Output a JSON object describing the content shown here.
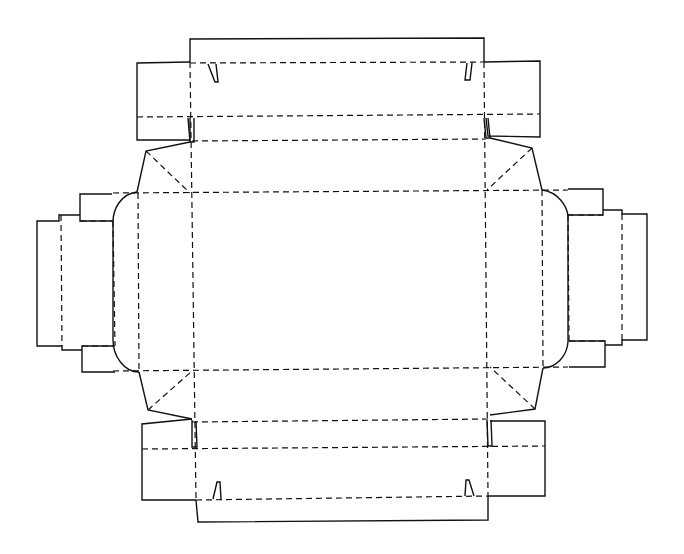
{
  "diagram": {
    "type": "box-net-dieline",
    "width": 684,
    "height": 554,
    "colors": {
      "background": "#ffffff",
      "line": "#111111"
    },
    "cut_lines": [
      {
        "name": "top-lid-flap",
        "points": "190,62 190,39 484,38 484,62"
      },
      {
        "name": "top-left-dust-flap",
        "points": "190,62 137,63 137,140 190,140 190,118"
      },
      {
        "name": "top-right-dust-flap",
        "points": "484,62 540,61 540,137 488,136 486,118"
      },
      {
        "name": "top-left-slot",
        "points": "188,118 190,142 194,142 194,118"
      },
      {
        "name": "top-right-slot",
        "points": "484,118 486,138 490,138 488,118"
      },
      {
        "name": "top-left-notch",
        "points": "208,64 215,82 218,82 216,64"
      },
      {
        "name": "top-right-notch",
        "points": "472,63 470,80 465,80 467,63"
      },
      {
        "name": "upper-left-gusset",
        "points": "190,142 146,151 137,192"
      },
      {
        "name": "upper-right-gusset",
        "points": "490,138 532,148 542,190"
      },
      {
        "name": "left-rounded-edge",
        "points": "137,192 C 120,194 113,210 113,222 L 113,340 C 113,356 124,372 139,372"
      },
      {
        "name": "right-rounded-edge",
        "points": "542,190 C 558,192 567,206 568,216 L 568,342 C 567,356 556,368 543,368"
      },
      {
        "name": "lower-left-gusset",
        "points": "139,372 148,410 192,419"
      },
      {
        "name": "lower-right-gusset",
        "points": "543,368 535,409 490,415"
      },
      {
        "name": "left-top-tab",
        "points": "113,221 80,221 80,194 112,194"
      },
      {
        "name": "left-bottom-tab",
        "points": "113,346 82,346 82,372 115,372"
      },
      {
        "name": "left-side-flap",
        "points": "80,215 59,215 59,221 37,221 37,346 62,346 62,350 82,350"
      },
      {
        "name": "right-top-tab",
        "points": "568,215 603,215 603,189 568,189"
      },
      {
        "name": "right-bottom-tab",
        "points": "569,341 605,341 605,367 569,367"
      },
      {
        "name": "right-side-flap",
        "points": "603,210 622,210 622,214 647,214 647,340 622,340 622,345 605,345"
      },
      {
        "name": "bottom-left-dust-flap",
        "points": "192,419 142,424 142,500 196,500"
      },
      {
        "name": "bottom-right-dust-flap",
        "points": "490,421 545,421 545,496 488,496"
      },
      {
        "name": "bottom-left-slot",
        "points": "192,420 192,447 197,447 196,421"
      },
      {
        "name": "bottom-right-slot",
        "points": "487,420 488,446 492,446 491,420"
      },
      {
        "name": "bottom-lid-flap",
        "points": "196,500 198,522 488,520 488,496"
      },
      {
        "name": "bottom-left-notch",
        "points": "213,499 217,482 220,482 221,499"
      },
      {
        "name": "bottom-right-notch",
        "points": "465,496 466,480 469,480 474,496"
      }
    ],
    "fold_lines": [
      {
        "name": "top-lid-fold",
        "x1": 190,
        "y1": 63,
        "x2": 484,
        "y2": 62
      },
      {
        "name": "top-flap-mid-fold",
        "x1": 137,
        "y1": 117,
        "x2": 540,
        "y2": 114
      },
      {
        "name": "top-panel-fold",
        "x1": 192,
        "y1": 141,
        "x2": 486,
        "y2": 139
      },
      {
        "name": "main-top-fold",
        "x1": 113,
        "y1": 193,
        "x2": 568,
        "y2": 190
      },
      {
        "name": "main-bottom-fold",
        "x1": 113,
        "y1": 371,
        "x2": 568,
        "y2": 367
      },
      {
        "name": "bottom-panel-fold",
        "x1": 192,
        "y1": 422,
        "x2": 490,
        "y2": 419
      },
      {
        "name": "bottom-flap-mid-fold",
        "x1": 142,
        "y1": 449,
        "x2": 545,
        "y2": 446
      },
      {
        "name": "bottom-lid-fold",
        "x1": 196,
        "y1": 500,
        "x2": 488,
        "y2": 496
      },
      {
        "name": "left-main-vertical",
        "x1": 190,
        "y1": 62,
        "x2": 196,
        "y2": 500
      },
      {
        "name": "right-main-vertical",
        "x1": 484,
        "y1": 62,
        "x2": 488,
        "y2": 496
      },
      {
        "name": "left-inner-vertical",
        "x1": 138,
        "y1": 193,
        "x2": 139,
        "y2": 372
      },
      {
        "name": "right-inner-vertical",
        "x1": 542,
        "y1": 190,
        "x2": 543,
        "y2": 368
      },
      {
        "name": "left-outer-vertical",
        "x1": 113,
        "y1": 221,
        "x2": 115,
        "y2": 346
      },
      {
        "name": "left-flap-vertical",
        "x1": 61,
        "y1": 215,
        "x2": 62,
        "y2": 346
      },
      {
        "name": "left-top-tab-fold",
        "x1": 80,
        "y1": 221,
        "x2": 113,
        "y2": 221
      },
      {
        "name": "left-bottom-tab-fold",
        "x1": 82,
        "y1": 346,
        "x2": 115,
        "y2": 346
      },
      {
        "name": "right-outer-vertical",
        "x1": 568,
        "y1": 215,
        "x2": 569,
        "y2": 341
      },
      {
        "name": "right-flap-vertical",
        "x1": 622,
        "y1": 214,
        "x2": 622,
        "y2": 340
      },
      {
        "name": "right-top-tab-fold",
        "x1": 568,
        "y1": 215,
        "x2": 603,
        "y2": 215
      },
      {
        "name": "right-bottom-tab-fold",
        "x1": 569,
        "y1": 341,
        "x2": 605,
        "y2": 341
      },
      {
        "name": "upper-left-diagonal",
        "x1": 146,
        "y1": 151,
        "x2": 190,
        "y2": 193
      },
      {
        "name": "upper-right-diagonal",
        "x1": 532,
        "y1": 148,
        "x2": 487,
        "y2": 190
      },
      {
        "name": "lower-left-diagonal",
        "x1": 148,
        "y1": 410,
        "x2": 192,
        "y2": 371
      },
      {
        "name": "lower-right-diagonal",
        "x1": 535,
        "y1": 409,
        "x2": 490,
        "y2": 367
      }
    ]
  }
}
